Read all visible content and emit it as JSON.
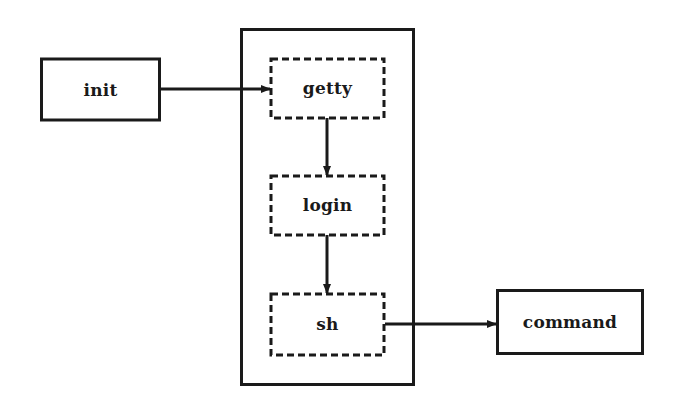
{
  "diagram": {
    "type": "process-flow",
    "colors": {
      "stroke": "#1a1a1a",
      "background": "#ffffff",
      "text": "#1a1a1a"
    },
    "nodes": [
      {
        "id": "init",
        "label": "init",
        "style": "solid"
      },
      {
        "id": "getty",
        "label": "getty",
        "style": "dashed"
      },
      {
        "id": "login",
        "label": "login",
        "style": "dashed"
      },
      {
        "id": "sh",
        "label": "sh",
        "style": "dashed"
      },
      {
        "id": "command",
        "label": "command",
        "style": "solid"
      }
    ],
    "groups": [
      {
        "id": "session-container",
        "contains": [
          "getty",
          "login",
          "sh"
        ],
        "style": "solid"
      }
    ],
    "edges": [
      {
        "from": "init",
        "to": "getty"
      },
      {
        "from": "getty",
        "to": "login"
      },
      {
        "from": "login",
        "to": "sh"
      },
      {
        "from": "sh",
        "to": "command"
      }
    ]
  }
}
